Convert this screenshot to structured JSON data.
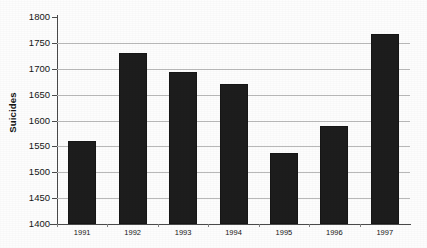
{
  "chart_data": {
    "type": "bar",
    "title": "",
    "xlabel": "",
    "ylabel": "Suicides",
    "categories": [
      "1991",
      "1992",
      "1993",
      "1994",
      "1995",
      "1996",
      "1997"
    ],
    "values": [
      1560,
      1731,
      1694,
      1670,
      1537,
      1589,
      1767
    ],
    "series": [
      {
        "name": "Suicides",
        "values": [
          1560,
          1731,
          1694,
          1670,
          1537,
          1589,
          1767
        ]
      }
    ],
    "ylim": [
      1400,
      1800
    ],
    "ytick_labels": [
      "1800",
      "1750",
      "1700",
      "1650",
      "1600",
      "1550",
      "1500",
      "1450",
      "1400"
    ],
    "ytick_values": [
      1800,
      1750,
      1700,
      1650,
      1600,
      1550,
      1500,
      1450,
      1400
    ],
    "ytick_step": 50,
    "grid": true,
    "grid_axis": "y",
    "legend": false,
    "legend_position": "none",
    "bar_color": "#1d1d1d",
    "grid_color": "#b9b9b9",
    "axis_color": "#4a4a4a",
    "background_color": "#fdfdfd"
  }
}
